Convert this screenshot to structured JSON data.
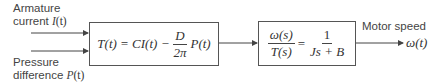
{
  "inputs": [
    {
      "label_line1": "Armature",
      "label_line2": "current",
      "signal": "I",
      "arg": "(t)"
    },
    {
      "label_line1": "Pressure",
      "label_line2": "difference",
      "signal": "P",
      "arg": "(t)"
    }
  ],
  "block1": {
    "lhs": "T(t) = CI(t) −",
    "frac_num": "D",
    "frac_den": "2π",
    "rhs": "P(t)"
  },
  "block2": {
    "lhs_num": "ω(s)",
    "lhs_den": "T(s)",
    "equals": "=",
    "rhs_num": "1",
    "rhs_den": "Js + B"
  },
  "output": {
    "label": "Motor speed",
    "signal": "ω(t)"
  },
  "colors": {
    "line": "#444444",
    "text": "#444444",
    "background": "#ffffff"
  }
}
